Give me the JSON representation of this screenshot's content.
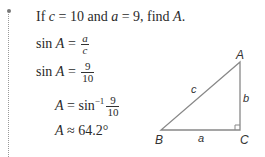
{
  "problem": {
    "prompt_prefix": "If ",
    "var_c": "c",
    "eq1": " = 10 and ",
    "var_a": "a",
    "eq2": " = 9, find ",
    "var_A": "A",
    "period": "."
  },
  "steps": [
    {
      "lhs_func": "sin ",
      "lhs_var": "A",
      "eq": " = ",
      "num": "a",
      "den": "c"
    },
    {
      "lhs_func": "sin ",
      "lhs_var": "A",
      "eq": " = ",
      "num": "9",
      "den": "10"
    },
    {
      "lhs_var": "A",
      "eq": " = sin",
      "sup": "−1",
      "num": "9",
      "den": "10"
    },
    {
      "lhs_var": "A",
      "eq": " ≈ 64.2°"
    }
  ],
  "triangle": {
    "vertices": {
      "A": "A",
      "B": "B",
      "C": "C"
    },
    "sides": {
      "a": "a",
      "b": "b",
      "c": "c"
    }
  }
}
